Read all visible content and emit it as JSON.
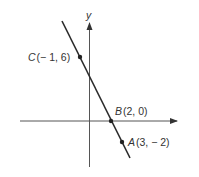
{
  "diagram": {
    "type": "coordinate-plane-line",
    "axes": {
      "x_label": "",
      "y_label": "y"
    },
    "line": {
      "description": "line through points C, B, A",
      "slope": -2
    },
    "points": [
      {
        "name": "C",
        "coords": "(− 1, 6)",
        "x": -1,
        "y": 6
      },
      {
        "name": "B",
        "coords": "(2, 0)",
        "x": 2,
        "y": 0
      },
      {
        "name": "A",
        "coords": "(3, − 2)",
        "x": 3,
        "y": -2
      }
    ]
  },
  "colors": {
    "line": "#2a2a2a",
    "axes": "#555555",
    "text": "#333333"
  }
}
